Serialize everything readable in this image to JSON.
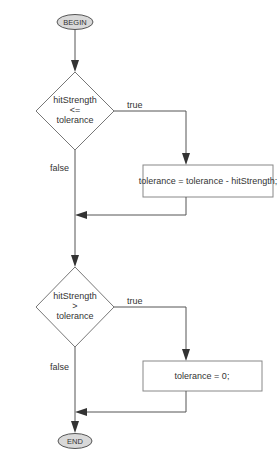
{
  "diagram": {
    "type": "flowchart",
    "colors": {
      "line": "#555555",
      "terminal_fill": "#d9d9d9",
      "text": "#333333",
      "box_stroke": "#888888"
    },
    "start": {
      "label": "BEGIN"
    },
    "end": {
      "label": "END"
    },
    "decision1": {
      "line1": "hitStrength",
      "line2": "<=",
      "line3": "tolerance",
      "true_label": "true",
      "false_label": "false"
    },
    "process1": {
      "label": "tolerance = tolerance - hitStrength;"
    },
    "decision2": {
      "line1": "hitStrength",
      "line2": ">",
      "line3": "tolerance",
      "true_label": "true",
      "false_label": "false"
    },
    "process2": {
      "label": "tolerance = 0;"
    }
  }
}
